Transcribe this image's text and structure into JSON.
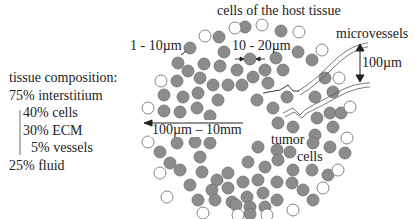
{
  "diagram": {
    "top_caption_partial": "...host cell... ...pores ... ...interstitial...",
    "labels": {
      "host_cells": "cells of the host tissue",
      "microvessels": "microvessels",
      "gap_size": "1 - 10µm",
      "cell_size": "10 - 20µm",
      "vessel_spacing": "100µm",
      "tumor_size": "100µm – 10mm",
      "tumor_cells_line1": "tumor",
      "tumor_cells_line2": "cells"
    },
    "composition": {
      "title": "tissue composition:",
      "items": [
        {
          "label": "75% interstitium",
          "indent": 0
        },
        {
          "label": "40% cells",
          "indent": 1
        },
        {
          "label": "30% ECM",
          "indent": 1
        },
        {
          "label": "5% vessels",
          "indent": 2
        },
        {
          "label": "25% fluid",
          "indent": 0
        }
      ]
    },
    "colors": {
      "tumor_cell_fill": "#8c8c8c",
      "tumor_cell_stroke": "#6f6f6f",
      "host_cell_stroke": "#777777",
      "line": "#222222"
    }
  }
}
